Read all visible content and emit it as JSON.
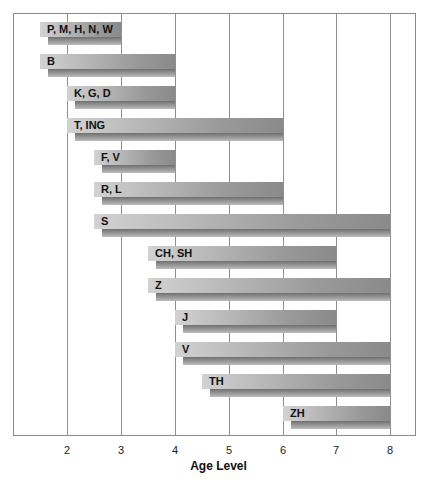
{
  "chart_data": {
    "type": "bar",
    "orientation": "horizontal-range",
    "title": "",
    "xlabel": "Age Level",
    "ylabel": "",
    "xlim": [
      1,
      8.5
    ],
    "xticks": [
      2,
      3,
      4,
      5,
      6,
      7,
      8
    ],
    "grid": true,
    "bars": [
      {
        "label": "P, M, H, N, W",
        "start": 1.5,
        "end": 3
      },
      {
        "label": "B",
        "start": 1.5,
        "end": 4
      },
      {
        "label": "K, G, D",
        "start": 2,
        "end": 4
      },
      {
        "label": "T, ING",
        "start": 2,
        "end": 6
      },
      {
        "label": "F, V",
        "start": 2.5,
        "end": 4
      },
      {
        "label": "R, L",
        "start": 2.5,
        "end": 6
      },
      {
        "label": "S",
        "start": 2.5,
        "end": 8
      },
      {
        "label": "CH, SH",
        "start": 3.5,
        "end": 7
      },
      {
        "label": "Z",
        "start": 3.5,
        "end": 8
      },
      {
        "label": "J",
        "start": 4,
        "end": 7
      },
      {
        "label": "V",
        "start": 4,
        "end": 8
      },
      {
        "label": "TH",
        "start": 4.5,
        "end": 8
      },
      {
        "label": "ZH",
        "start": 6,
        "end": 8
      }
    ]
  }
}
